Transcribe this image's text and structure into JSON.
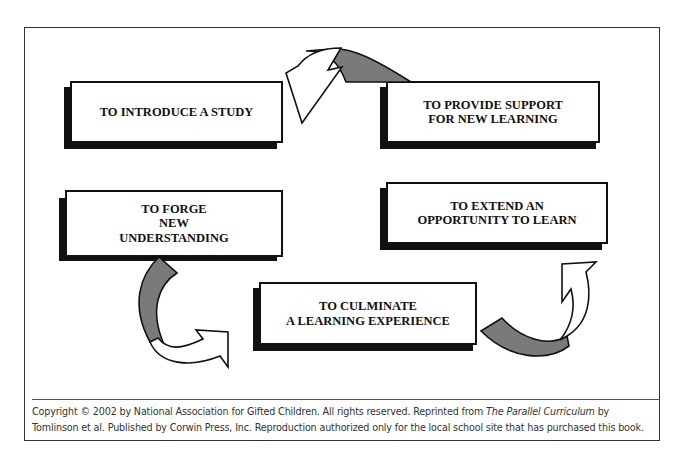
{
  "diagram": {
    "type": "cycle",
    "nodes": [
      {
        "id": "introduce",
        "label": "TO INTRODUCE A STUDY"
      },
      {
        "id": "support",
        "label": "TO PROVIDE SUPPORT\nFOR NEW LEARNING"
      },
      {
        "id": "extend",
        "label": "TO EXTEND AN\nOPPORTUNITY TO LEARN"
      },
      {
        "id": "culminate",
        "label": "TO CULMINATE\nA LEARNING EXPERIENCE"
      },
      {
        "id": "forge",
        "label": "TO FORGE\nNEW\nUNDERSTANDING"
      }
    ],
    "arrows": [
      {
        "from": "support",
        "to": "introduce"
      },
      {
        "from": "forge",
        "to": "culminate"
      },
      {
        "from": "culminate",
        "to": "extend"
      }
    ],
    "colors": {
      "box_border": "#111111",
      "shadow": "#111111",
      "arrow_fill_front": "#ffffff",
      "arrow_fill_back": "#7a7a7a",
      "frame": "#333333"
    }
  },
  "footer": {
    "line1_pre": "Copyright © 2002 by National Association for Gifted Children. All rights reserved. Reprinted from ",
    "line1_title": "The Parallel Curriculum",
    "line1_post": " by",
    "line2": "Tomlinson et al. Published by Corwin Press, Inc. Reproduction authorized only for the local school site that has purchased this book."
  }
}
